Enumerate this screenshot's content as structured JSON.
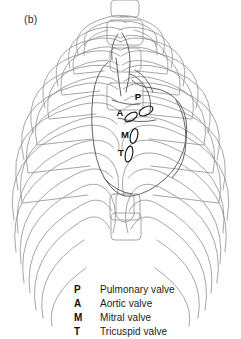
{
  "figure": {
    "panel_label": "(b)",
    "caption_alt": "Anterior view of the ribcage with the heart silhouette and the four cardiac valve auscultation sites"
  },
  "diagram": {
    "type": "anatomical-line-drawing",
    "line_color": "#8a8a8a",
    "heart_line_color": "#4a4a4a",
    "valve_line_color": "#1a1a1a",
    "background": "#ffffff",
    "parts": [
      {
        "name": "sternum-manubrium",
        "label": ""
      },
      {
        "name": "sternum-body",
        "label": ""
      },
      {
        "name": "xiphoid-process",
        "label": ""
      },
      {
        "name": "ribcage-left",
        "label": ""
      },
      {
        "name": "ribcage-right",
        "label": ""
      },
      {
        "name": "costal-margin",
        "label": ""
      },
      {
        "name": "heart-outline",
        "label": ""
      },
      {
        "name": "aorta",
        "label": ""
      },
      {
        "name": "pulmonary-trunk",
        "label": ""
      }
    ]
  },
  "valve_marks": [
    {
      "key": "P",
      "name": "pulmonary-valve",
      "x": 138,
      "y": 97
    },
    {
      "key": "A",
      "name": "aortic-valve",
      "x": 120,
      "y": 113
    },
    {
      "key": "M",
      "name": "mitral-valve",
      "x": 125,
      "y": 135
    },
    {
      "key": "T",
      "name": "tricuspid-valve",
      "x": 121,
      "y": 153
    }
  ],
  "legend": {
    "rows": [
      {
        "key": "P",
        "label": "Pulmonary valve"
      },
      {
        "key": "A",
        "label": "Aortic valve"
      },
      {
        "key": "M",
        "label": "Mitral valve"
      },
      {
        "key": "T",
        "label": "Tricuspid valve"
      }
    ]
  }
}
